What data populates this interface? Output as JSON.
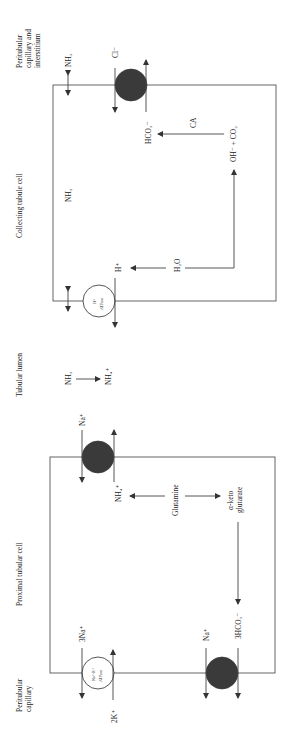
{
  "regions": {
    "peritubular_interstitium": [
      "Peritubular",
      "capillary and",
      "interstitium"
    ],
    "collecting_cell": "Collecting tubule cell",
    "tubular_lumen": "Tubular lumen",
    "proximal_cell": "Proximal tubular cell",
    "peritubular_capillary": [
      "Peritubular",
      "capillary"
    ]
  },
  "collecting_cell": {
    "nh3_basolateral": "NH₃",
    "cl": "Cl⁻",
    "hco3": "HCO₃⁻",
    "ca": "CA",
    "oh_co2": "OH⁻  + CO₂",
    "nh3_inner": "NH₃",
    "h2o": "H₂O",
    "h_plus": "H⁺",
    "h_atpase_line1": "H⁺",
    "h_atpase_line2": "ATPase"
  },
  "lumen": {
    "nh3": "NH₃",
    "nh4": "NH₄⁺"
  },
  "proximal_cell": {
    "na_apical": "Na⁺",
    "nh4": "NH₄⁺",
    "glutamine": "Glutamine",
    "alpha_keto_line1": "α-keto",
    "alpha_keto_line2": "glutarate",
    "hco3_3": "3HCO₃⁻",
    "na_basolateral": "Na⁺",
    "na3": "3Na⁺",
    "k2": "2K⁺",
    "nak_atpase_line1": "Na⁺-K⁺",
    "nak_atpase_line2": "ATPase"
  },
  "colors": {
    "line": "#444444",
    "transporter_fill": "#3a3a3a",
    "background": "#ffffff"
  }
}
